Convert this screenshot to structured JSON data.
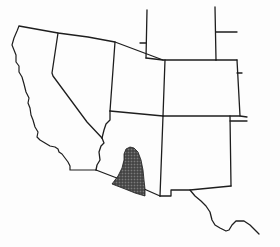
{
  "map": {
    "type": "regional outline map",
    "region": "Southwestern United States",
    "background_color": "#fdfdfd",
    "line_color": "#1e1e1e",
    "highlight": {
      "name": "shaded-distribution-range",
      "location": "southeastern Arizona / southwestern New Mexico border region",
      "fill_color": "#4a4a4a",
      "pattern": "stippled dark shading"
    },
    "states_outlined": [
      "California",
      "Nevada",
      "Utah",
      "Arizona",
      "Colorado",
      "New Mexico"
    ],
    "labels": []
  }
}
